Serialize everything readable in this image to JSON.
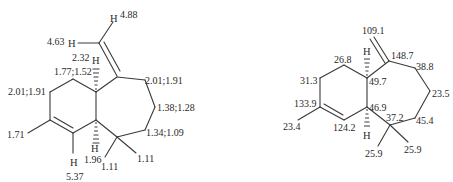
{
  "left_structure": {
    "name": "1H NMR chemical shifts",
    "atoms": {
      "h": "H"
    },
    "labels": {
      "h_vinyl_a": "4.88",
      "h_vinyl_b": "4.63",
      "h_fusion_top": "2.32",
      "ch2_a": "1.77;1.52",
      "ch2_b": "2.01;1.91",
      "ch2_c": "2.01;1.91",
      "ch2_d": "1.38;1.28",
      "ch2_e": "1.34;1.09",
      "methyl_ring": "1.71",
      "h_olefin": "5.37",
      "h_fusion_bottom": "1.96",
      "methyl_a": "1.11",
      "methyl_b": "1.11"
    }
  },
  "right_structure": {
    "name": "13C NMR chemical shifts",
    "atoms": {
      "h": "H"
    },
    "labels": {
      "exo_ch2": "109.1",
      "c_exo": "148.7",
      "c_a": "38.8",
      "c_b": "23.5",
      "c_c": "45.4",
      "c_quat": "37.2",
      "c_fusion_top": "49.7",
      "c_fusion_bottom": "46.9",
      "c_ring_a": "26.8",
      "c_ring_b": "31.3",
      "c_olefin_sub": "133.9",
      "c_olefin_h": "124.2",
      "methyl_ring": "23.4",
      "methyl_a": "25.9",
      "methyl_b": "25.9"
    }
  }
}
